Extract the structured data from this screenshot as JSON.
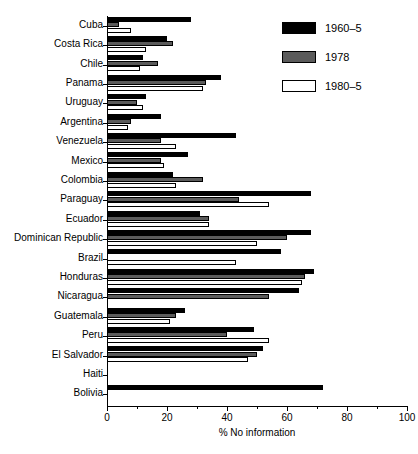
{
  "chart_data": {
    "type": "bar",
    "orientation": "horizontal",
    "title": "",
    "xlabel": "% No information",
    "ylabel": "",
    "xlim": [
      0,
      100
    ],
    "xticks": [
      0,
      20,
      40,
      60,
      80,
      100
    ],
    "xtick_labels": [
      "0",
      "20",
      "40",
      "60",
      "80",
      "100"
    ],
    "grid": false,
    "legend_position": "top-right",
    "categories": [
      "Cuba",
      "Costa Rica",
      "Chile",
      "Panama",
      "Uruguay",
      "Argentina",
      "Venezuela",
      "Mexico",
      "Colombia",
      "Paraguay",
      "Ecuador",
      "Dominican Republic",
      "Brazil",
      "Honduras",
      "Nicaragua",
      "Guatemala",
      "Peru",
      "El Salvador",
      "Haiti",
      "Bolivia"
    ],
    "series": [
      {
        "name": "1960–5",
        "fill": "solid-black",
        "color": "#000000",
        "values": [
          28,
          20,
          12,
          38,
          13,
          18,
          43,
          27,
          22,
          68,
          31,
          68,
          58,
          69,
          64,
          26,
          49,
          52,
          null,
          72
        ]
      },
      {
        "name": "1978",
        "fill": "cross-hatch",
        "color": "#c9c9c9",
        "values": [
          4,
          22,
          17,
          33,
          10,
          8,
          18,
          18,
          32,
          44,
          34,
          60,
          null,
          66,
          54,
          23,
          40,
          50,
          null,
          null
        ]
      },
      {
        "name": "1980–5",
        "fill": "white",
        "color": "#ffffff",
        "values": [
          8,
          13,
          11,
          32,
          12,
          7,
          23,
          19,
          23,
          54,
          34,
          50,
          43,
          65,
          null,
          21,
          54,
          47,
          null,
          null
        ]
      }
    ]
  }
}
